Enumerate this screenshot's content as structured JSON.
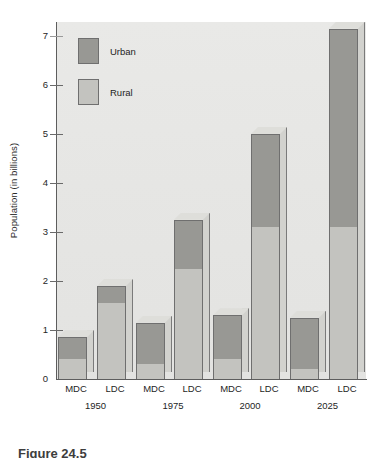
{
  "figure": {
    "caption": "Figure 24.5"
  },
  "chart_data": {
    "type": "bar",
    "subtype": "stacked-bar",
    "title": "",
    "xlabel": "",
    "ylabel": "Population (in billions)",
    "ylim": [
      0,
      7.4
    ],
    "yticks": [
      0,
      1,
      2,
      3,
      4,
      5,
      6,
      7
    ],
    "ytick_labels": [
      "0",
      "1",
      "2",
      "3",
      "4",
      "5",
      "6",
      "7"
    ],
    "grid": false,
    "legend_position": "upper-left",
    "legend": [
      "Urban",
      "Rural"
    ],
    "colors": {
      "urban": "#989894",
      "rural": "#c3c3bf",
      "plot_background": "#e6e6e4",
      "axis": "#5d5d5d",
      "bar_outline": "#6f6f6f",
      "side_face": "#d2d2ce"
    },
    "categories": [
      "MDC",
      "LDC",
      "MDC",
      "LDC",
      "MDC",
      "LDC",
      "MDC",
      "LDC"
    ],
    "groups": [
      "1950",
      "1975",
      "2000",
      "2025"
    ],
    "series": [
      {
        "name": "Rural",
        "values": [
          0.4,
          1.55,
          0.3,
          2.25,
          0.4,
          3.1,
          0.2,
          3.1
        ]
      },
      {
        "name": "Urban",
        "values": [
          0.45,
          0.35,
          0.85,
          1.0,
          0.9,
          1.9,
          1.05,
          4.05
        ]
      }
    ],
    "totals": [
      0.85,
      1.9,
      1.15,
      3.25,
      1.3,
      5.0,
      1.25,
      7.15
    ],
    "bars": [
      {
        "group": "1950",
        "category": "MDC",
        "rural": 0.4,
        "urban": 0.45,
        "total": 0.85
      },
      {
        "group": "1950",
        "category": "LDC",
        "rural": 1.55,
        "urban": 0.35,
        "total": 1.9
      },
      {
        "group": "1975",
        "category": "MDC",
        "rural": 0.3,
        "urban": 0.85,
        "total": 1.15
      },
      {
        "group": "1975",
        "category": "LDC",
        "rural": 2.25,
        "urban": 1.0,
        "total": 3.25
      },
      {
        "group": "2000",
        "category": "MDC",
        "rural": 0.4,
        "urban": 0.9,
        "total": 1.3
      },
      {
        "group": "2000",
        "category": "LDC",
        "rural": 3.1,
        "urban": 1.9,
        "total": 5.0
      },
      {
        "group": "2025",
        "category": "MDC",
        "rural": 0.2,
        "urban": 1.05,
        "total": 1.25
      },
      {
        "group": "2025",
        "category": "LDC",
        "rural": 3.1,
        "urban": 4.05,
        "total": 7.15
      }
    ]
  }
}
